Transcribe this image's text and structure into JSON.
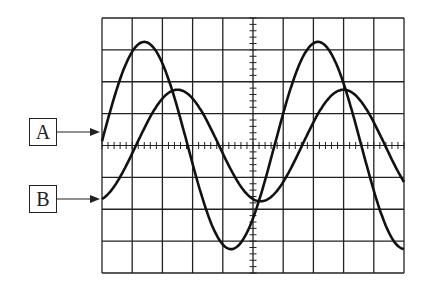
{
  "figure": {
    "grid": {
      "columns": 10,
      "rows": 8,
      "center_axes_graticule": true
    }
  },
  "labels": [
    {
      "id": "A",
      "text": "A",
      "points_to": "trace A (larger amplitude, leading)"
    },
    {
      "id": "B",
      "text": "B",
      "points_to": "trace B (smaller amplitude, lagging)"
    }
  ],
  "chart_data": {
    "type": "line",
    "title": "",
    "xlabel": "time (divisions)",
    "ylabel": "voltage (divisions)",
    "xlim": [
      0,
      10
    ],
    "ylim": [
      -4,
      4
    ],
    "grid": true,
    "series": [
      {
        "name": "A",
        "amplitude_div": 3.25,
        "period_div": 5.75,
        "value_at_left_edge_div": 0.0,
        "peaks_x_div": [
          1.4,
          7.0
        ],
        "troughs_x_div": [
          4.2,
          9.8
        ]
      },
      {
        "name": "B",
        "amplitude_div": 1.75,
        "period_div": 5.5,
        "value_at_left_edge_div": -1.75,
        "peaks_x_div": [
          2.5,
          8.3
        ],
        "troughs_x_div": [
          5.2
        ]
      }
    ]
  }
}
